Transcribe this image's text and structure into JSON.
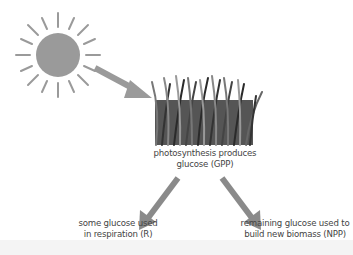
{
  "diagram": {
    "title": "",
    "nodes": [
      {
        "id": "sun",
        "icon": "sun-icon"
      },
      {
        "id": "grass",
        "icon": "grass-icon",
        "label_line1": "photosynthesis produces",
        "label_line2": "glucose (GPP)"
      },
      {
        "id": "respiration",
        "label_line1": "some glucose used",
        "label_line2": "in respiration (R)"
      },
      {
        "id": "npp",
        "label_line1": "remaining glucose used to",
        "label_line2": "build new biomass (NPP)"
      }
    ],
    "edges": [
      {
        "from": "sun",
        "to": "grass"
      },
      {
        "from": "grass",
        "to": "respiration"
      },
      {
        "from": "grass",
        "to": "npp"
      }
    ],
    "colors": {
      "sun": "#9a9a9a",
      "arrow": "#8a8a8a",
      "text": "#444444",
      "grass_dark": "#2a2a2a",
      "grass_light": "#9a9a9a"
    }
  }
}
